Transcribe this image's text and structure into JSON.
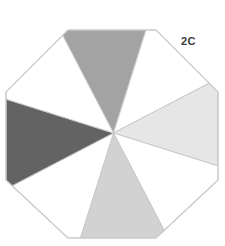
{
  "figure": {
    "label": "2C",
    "label_name": "figure-code-label",
    "background_color": "#ffffff",
    "outline_color": "#c9c9c9",
    "shape": "octagon",
    "sector_count": 8,
    "center": {
      "x": 113.5,
      "y": 133.0
    },
    "rotation_degrees": -5,
    "octagon_vertices": [
      {
        "x": 68,
        "y": 30
      },
      {
        "x": 156,
        "y": 30
      },
      {
        "x": 218,
        "y": 92
      },
      {
        "x": 218,
        "y": 180
      },
      {
        "x": 156,
        "y": 238
      },
      {
        "x": 68,
        "y": 238
      },
      {
        "x": 6,
        "y": 180
      },
      {
        "x": 6,
        "y": 92
      }
    ],
    "sectors": [
      {
        "index": 0,
        "position": "top",
        "fill": "#a3a3a3",
        "shaded": true,
        "name": "sector-top"
      },
      {
        "index": 1,
        "position": "top-right",
        "fill": "#ffffff",
        "shaded": false,
        "name": "sector-top-right"
      },
      {
        "index": 2,
        "position": "right",
        "fill": "#e6e6e6",
        "shaded": true,
        "name": "sector-right"
      },
      {
        "index": 3,
        "position": "bottom-right",
        "fill": "#ffffff",
        "shaded": false,
        "name": "sector-bottom-right"
      },
      {
        "index": 4,
        "position": "bottom",
        "fill": "#d2d2d2",
        "shaded": true,
        "name": "sector-bottom"
      },
      {
        "index": 5,
        "position": "bottom-left",
        "fill": "#ffffff",
        "shaded": false,
        "name": "sector-bottom-left"
      },
      {
        "index": 6,
        "position": "left",
        "fill": "#636363",
        "shaded": true,
        "name": "sector-left"
      },
      {
        "index": 7,
        "position": "top-left",
        "fill": "#ffffff",
        "shaded": false,
        "name": "sector-top-left"
      }
    ]
  }
}
